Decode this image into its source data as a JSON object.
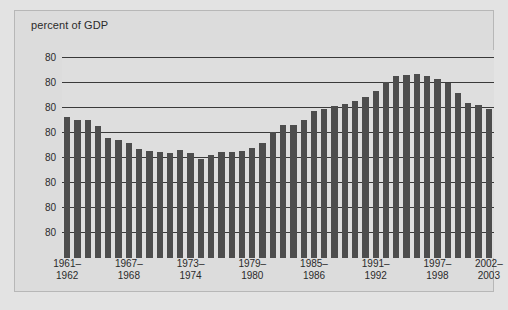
{
  "chart_data": {
    "type": "bar",
    "title": "percent of GDP",
    "xlabel": "",
    "ylabel": "percent of GDP",
    "grid": true,
    "legend": "none",
    "ytick_labels": [
      "80",
      "80",
      "80",
      "80",
      "80",
      "80",
      "80",
      "80"
    ],
    "ylim": [
      0,
      100
    ],
    "yticks": [
      96,
      84,
      72,
      60,
      48,
      36,
      24,
      12
    ],
    "xtick_labels": [
      {
        "line1": "1961–",
        "line2": "1962"
      },
      {
        "line1": "1967–",
        "line2": "1968"
      },
      {
        "line1": "1973–",
        "line2": "1974"
      },
      {
        "line1": "1979–",
        "line2": "1980"
      },
      {
        "line1": "1985–",
        "line2": "1986"
      },
      {
        "line1": "1991–",
        "line2": "1992"
      },
      {
        "line1": "1997–",
        "line2": "1998"
      },
      {
        "line1": "2002–",
        "line2": "2003"
      }
    ],
    "xtick_bar_index": [
      0,
      6,
      12,
      18,
      24,
      30,
      36,
      41
    ],
    "categories": [
      "1961-1962",
      "1962-1963",
      "1963-1964",
      "1964-1965",
      "1965-1966",
      "1966-1967",
      "1967-1968",
      "1968-1969",
      "1969-1970",
      "1970-1971",
      "1971-1972",
      "1972-1973",
      "1973-1974",
      "1974-1975",
      "1975-1976",
      "1976-1977",
      "1977-1978",
      "1978-1979",
      "1979-1980",
      "1980-1981",
      "1981-1982",
      "1982-1983",
      "1983-1984",
      "1984-1985",
      "1985-1986",
      "1986-1987",
      "1987-1988",
      "1988-1989",
      "1989-1990",
      "1990-1991",
      "1991-1992",
      "1992-1993",
      "1993-1994",
      "1994-1995",
      "1995-1996",
      "1996-1997",
      "1997-1998",
      "1998-1999",
      "1999-2000",
      "2000-2001",
      "2001-2002",
      "2002-2003"
    ],
    "values": [
      68.0,
      66.5,
      66.5,
      63.5,
      57.5,
      56.5,
      55.5,
      52.5,
      51.5,
      51.0,
      50.5,
      52.0,
      50.5,
      47.5,
      49.5,
      51.0,
      51.0,
      51.5,
      53.0,
      55.5,
      60.5,
      64.0,
      64.0,
      66.5,
      70.5,
      71.5,
      73.0,
      74.0,
      75.5,
      77.5,
      80.5,
      84.5,
      87.5,
      88.0,
      88.5,
      87.5,
      86.0,
      84.0,
      79.5,
      74.5,
      73.5,
      71.5
    ],
    "bar_color": "#4d4d4d",
    "panel_color": "#dedede",
    "page_color": "#dcdcdc",
    "gridline_color": "#3a3a3a"
  }
}
